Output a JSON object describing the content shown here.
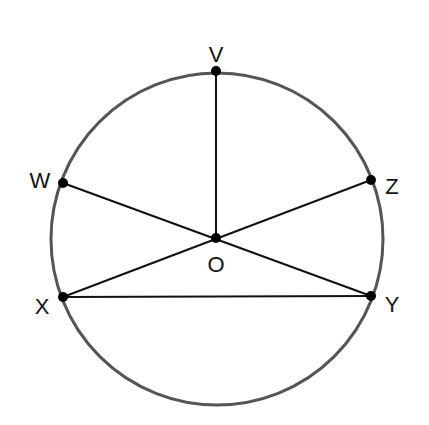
{
  "diagram": {
    "type": "circle-geometry",
    "circle": {
      "cx": 217,
      "cy": 239,
      "r": 166,
      "stroke": "#555555"
    },
    "points": [
      {
        "id": "V",
        "label": "V",
        "x": 216,
        "y": 71,
        "lx": 216,
        "ly": 56,
        "anchor": "middle"
      },
      {
        "id": "W",
        "label": "W",
        "x": 63,
        "y": 183,
        "lx": 40,
        "ly": 182,
        "anchor": "middle"
      },
      {
        "id": "Z",
        "label": "Z",
        "x": 371,
        "y": 180,
        "lx": 392,
        "ly": 188,
        "anchor": "middle"
      },
      {
        "id": "O",
        "label": "O",
        "x": 216,
        "y": 238,
        "lx": 216,
        "ly": 266,
        "anchor": "middle"
      },
      {
        "id": "X",
        "label": "X",
        "x": 63,
        "y": 297,
        "lx": 42,
        "ly": 308,
        "anchor": "middle"
      },
      {
        "id": "Y",
        "label": "Y",
        "x": 371,
        "y": 296,
        "lx": 392,
        "ly": 306,
        "anchor": "middle"
      }
    ],
    "segments": [
      {
        "from": "V",
        "to": "O"
      },
      {
        "from": "W",
        "to": "Y"
      },
      {
        "from": "Z",
        "to": "X"
      },
      {
        "from": "X",
        "to": "Y"
      }
    ],
    "colors": {
      "line": "#111111",
      "point": "#000000",
      "circle": "#555555"
    }
  }
}
